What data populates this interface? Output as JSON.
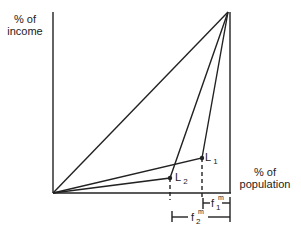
{
  "diagram": {
    "y_axis_label": [
      "% of",
      "income"
    ],
    "x_axis_label": [
      "% of",
      "population"
    ],
    "points": [
      {
        "name": "L",
        "sub": "1"
      },
      {
        "name": "L",
        "sub": "2"
      }
    ],
    "brackets": [
      {
        "name": "f",
        "sup": "m",
        "sub": "1"
      },
      {
        "name": "f",
        "sup": "m",
        "sub": "2"
      }
    ],
    "line_color": "#222222"
  }
}
